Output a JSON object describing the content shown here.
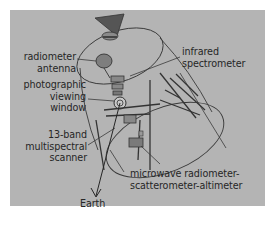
{
  "diagram": {
    "background_color": "#b4b4b4",
    "line_color": "#3a3a3a",
    "labels": {
      "radiometer_antenna": [
        "radiometer",
        "antenna"
      ],
      "photographic_viewing_window": [
        "photographic",
        "viewing",
        "window"
      ],
      "multispectral_scanner": [
        "13-band",
        "multispectral",
        "scanner"
      ],
      "infrared_spectrometer": [
        "infrared",
        "spectrometer"
      ],
      "microwave": [
        "microwave radiometer-",
        "scatterometer-altimeter"
      ],
      "earth": "Earth"
    }
  }
}
